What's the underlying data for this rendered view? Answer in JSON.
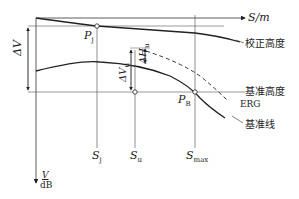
{
  "diagram": {
    "axes": {
      "x_label": "S/m",
      "y_label_num": "V",
      "y_label_den": "dB"
    },
    "points": {
      "pj": "P",
      "pj_sub": "j",
      "pb": "P",
      "pb_sub": "B"
    },
    "ticks": {
      "sj": "S",
      "sj_sub": "j",
      "su": "S",
      "su_sub": "u",
      "smax": "S",
      "smax_sub": "max"
    },
    "deltas": {
      "delta_v": "ΔV",
      "delta_vu": "ΔV",
      "delta_vu_sub": "u",
      "delta_hu": "ΔH",
      "delta_hu_sub": "u"
    },
    "curve_labels": {
      "corrected_height": "校正高度",
      "reference_height": "基准高度",
      "erg": "ERG",
      "reference_line": "基准线"
    }
  }
}
